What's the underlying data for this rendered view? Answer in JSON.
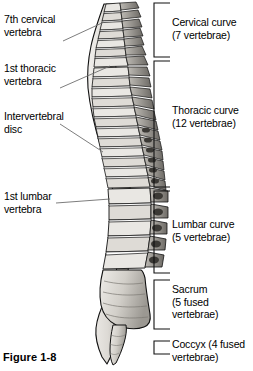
{
  "figure": {
    "caption": "Figure 1-8"
  },
  "left_labels": [
    {
      "id": "c7",
      "name": "7th-cervical-vertebra",
      "text": "7th cervical\nvertebra"
    },
    {
      "id": "t1",
      "name": "1st-thoracic-vertebra",
      "text": "1st thoracic\nvertebra"
    },
    {
      "id": "disc",
      "name": "intervertebral-disc",
      "text": "Intervertebral\ndisc"
    },
    {
      "id": "l1",
      "name": "1st-lumbar-vertebra",
      "text": "1st lumbar\nvertebra"
    }
  ],
  "right_labels": [
    {
      "id": "cervical",
      "name": "cervical-curve",
      "text": "Cervical curve\n(7 vertebrae)",
      "count": 7,
      "region": "Cervical curve"
    },
    {
      "id": "thoracic",
      "name": "thoracic-curve",
      "text": "Thoracic curve\n(12 vertebrae)",
      "count": 12,
      "region": "Thoracic curve"
    },
    {
      "id": "lumbar",
      "name": "lumbar-curve",
      "text": "Lumbar curve\n(5 vertebrae)",
      "count": 5,
      "region": "Lumbar curve"
    },
    {
      "id": "sacrum",
      "name": "sacrum",
      "text": "Sacrum\n(5 fused\nvertebrae)",
      "count": 5,
      "region": "Sacrum"
    },
    {
      "id": "coccyx",
      "name": "coccyx",
      "text": "Coccyx (4 fused\nvertebrae)",
      "count": 4,
      "region": "Coccyx"
    }
  ],
  "colors": {
    "ink": "#000000",
    "bone_light": "#e8e6e2",
    "bone_mid": "#c9c6c0",
    "bone_dark": "#8e8b85",
    "bone_shadow": "#4a4843",
    "leader_line": "#6e6e6e",
    "background": "#ffffff"
  }
}
